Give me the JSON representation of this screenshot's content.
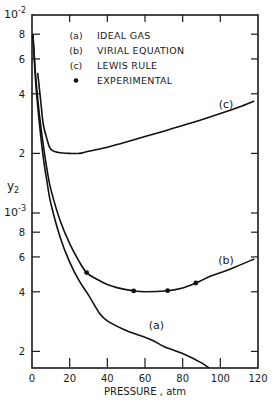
{
  "chart_data": {
    "type": "line",
    "title": "",
    "xlabel": "PRESSURE , atm",
    "ylabel": "y2",
    "xlim": [
      0,
      120
    ],
    "ylim": [
      0.000165,
      0.01
    ],
    "yscale": "log",
    "grid": false,
    "legend_position": "upper-center-inside",
    "x_ticks": [
      0,
      20,
      40,
      60,
      80,
      100,
      120
    ],
    "x_tick_labels": [
      "0",
      "20",
      "40",
      "60",
      "80",
      "100",
      "120"
    ],
    "y_ticks": [
      0.01,
      0.008,
      0.006,
      0.004,
      0.002,
      0.001,
      0.0008,
      0.0006,
      0.0004,
      0.0002
    ],
    "y_tick_labels": [
      "10-2",
      "8",
      "6",
      "4",
      "2",
      "10-3",
      "8",
      "6",
      "4",
      "2"
    ],
    "legend": [
      {
        "key": "(a)",
        "label": "IDEAL GAS"
      },
      {
        "key": "(b)",
        "label": "VIRIAL EQUATION"
      },
      {
        "key": "(c)",
        "label": "LEWIS RULE"
      },
      {
        "key": "•",
        "label": "EXPERIMENTAL"
      }
    ],
    "series": [
      {
        "name": "(a) IDEAL GAS",
        "x": [
          0.5,
          2,
          4,
          6,
          8,
          10,
          15,
          20,
          25,
          30,
          36,
          40,
          50,
          63,
          70,
          80,
          90,
          94
        ],
        "y": [
          0.008,
          0.0045,
          0.0028,
          0.0019,
          0.00143,
          0.00112,
          0.00075,
          0.000565,
          0.000455,
          0.000385,
          0.00031,
          0.000285,
          0.000255,
          0.00023,
          0.000212,
          0.000195,
          0.000175,
          0.000165
        ]
      },
      {
        "name": "(b) VIRIAL EQUATION",
        "x": [
          0.5,
          2,
          4,
          6,
          8,
          10,
          15,
          20,
          25,
          29,
          35,
          40,
          45,
          54,
          60,
          72,
          80,
          87,
          95,
          105,
          118
        ],
        "y": [
          0.008,
          0.0048,
          0.0031,
          0.0022,
          0.00165,
          0.00132,
          0.00091,
          0.0007,
          0.00057,
          0.0005,
          0.00046,
          0.000435,
          0.00042,
          0.000404,
          0.0004,
          0.000405,
          0.000418,
          0.000443,
          0.00048,
          0.00052,
          0.000586
        ]
      },
      {
        "name": "(c) LEWIS RULE",
        "x": [
          3,
          4,
          5,
          6,
          8,
          10,
          14,
          20,
          25,
          30,
          40,
          50,
          60,
          70,
          80,
          90,
          100,
          110,
          118
        ],
        "y": [
          0.0051,
          0.0042,
          0.0034,
          0.0028,
          0.00235,
          0.0021,
          0.00202,
          0.002,
          0.002,
          0.00205,
          0.00215,
          0.00228,
          0.00243,
          0.00259,
          0.00277,
          0.00296,
          0.00318,
          0.00343,
          0.00368
        ]
      },
      {
        "name": "EXPERIMENTAL",
        "type": "scatter",
        "x": [
          29,
          54,
          72,
          87
        ],
        "y": [
          0.0005,
          0.000404,
          0.000405,
          0.000443
        ]
      }
    ],
    "annotations": [
      {
        "text": "(a)",
        "x": 66,
        "y": 0.00026
      },
      {
        "text": "(b)",
        "x": 103,
        "y": 0.00055
      },
      {
        "text": "(c)",
        "x": 103,
        "y": 0.0034
      }
    ]
  },
  "labels": {
    "y_exp_top_base": "10",
    "y_exp_top_sup": "-2",
    "y_exp_mid_base": "10",
    "y_exp_mid_sup": "-3",
    "ylabel_main": "y",
    "ylabel_sub": "2",
    "xlabel": "PRESSURE , atm"
  }
}
